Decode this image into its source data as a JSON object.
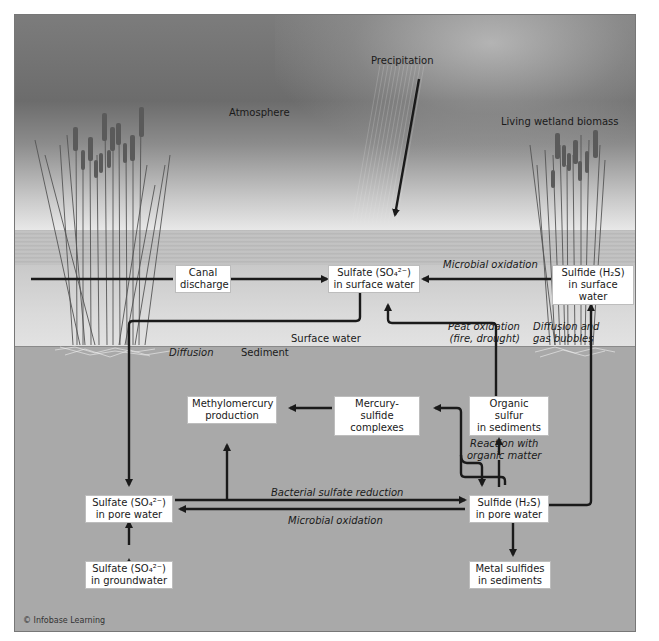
{
  "zones": {
    "atmosphere": "Atmosphere",
    "precipitation": "Precipitation",
    "living_biomass": "Living wetland biomass",
    "surface_water": "Surface water",
    "sediment": "Sediment"
  },
  "boxes": {
    "canal_discharge": [
      "Canal",
      "discharge"
    ],
    "sulfate_surface": [
      "Sulfate (SO₄²⁻)",
      "in surface water"
    ],
    "sulfide_surface": [
      "Sulfide (H₂S)",
      "in surface water"
    ],
    "methylmercury": [
      "Methylomercury",
      "production"
    ],
    "mercury_sulfide": [
      "Mercury-sulfide",
      "complexes"
    ],
    "organic_sulfur": [
      "Organic sulfur",
      "in sediments"
    ],
    "sulfate_pore": [
      "Sulfate (SO₄²⁻)",
      "in pore water"
    ],
    "sulfide_pore": [
      "Sulfide (H₂S)",
      "in pore water"
    ],
    "sulfate_ground": [
      "Sulfate (SO₄²⁻)",
      "in groundwater"
    ],
    "metal_sulfides": [
      "Metal sulfides",
      "in sediments"
    ]
  },
  "process_labels": {
    "microbial_oxidation_top": "Microbial oxidation",
    "peat_oxidation": [
      "Peat oxidation",
      "(fire, drought)"
    ],
    "diffusion_gas": [
      "Diffusion and",
      "gas bubbles"
    ],
    "diffusion": "Diffusion",
    "reaction_organic": [
      "Reaction with",
      "organic matter"
    ],
    "bacterial_reduction": "Bacterial sulfate reduction",
    "microbial_oxidation_bottom": "Microbial oxidation"
  },
  "credit": "© Infobase Learning",
  "colors": {
    "arrow": "#1a1a1a",
    "box_bg": "#ffffff",
    "sediment": "#a9a9a9",
    "surface_water": "#d8d8d8"
  }
}
